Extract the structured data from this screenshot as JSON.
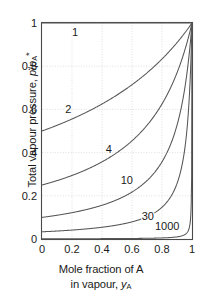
{
  "chart_data": {
    "type": "line",
    "title": "",
    "xlabel": "Mole fraction of A in vapour, yA",
    "ylabel": "Total vapour pressure, p/pA*",
    "xlim": [
      0,
      1
    ],
    "ylim": [
      0,
      1
    ],
    "grid": true,
    "legend_position": "inline-curve-labels",
    "x_ticks": [
      "0",
      "0.2",
      "0.4",
      "0.6",
      "0.8",
      "1"
    ],
    "x_tick_values": [
      0,
      0.2,
      0.4,
      0.6,
      0.8,
      1
    ],
    "y_ticks": [
      "0",
      "0.2",
      "0.4",
      "0.6",
      "0.8",
      "1"
    ],
    "y_tick_values": [
      0,
      0.2,
      0.4,
      0.6,
      0.8,
      1
    ],
    "x": [
      0,
      0.05,
      0.1,
      0.15,
      0.2,
      0.25,
      0.3,
      0.35,
      0.4,
      0.45,
      0.5,
      0.55,
      0.6,
      0.65,
      0.7,
      0.75,
      0.8,
      0.85,
      0.9,
      0.95,
      1
    ],
    "series": [
      {
        "name": "1",
        "ratio": 1,
        "values": [
          1,
          1,
          1,
          1,
          1,
          1,
          1,
          1,
          1,
          1,
          1,
          1,
          1,
          1,
          1,
          1,
          1,
          1,
          1,
          1,
          1
        ]
      },
      {
        "name": "2",
        "ratio": 2,
        "values": [
          0.5,
          0.513,
          0.526,
          0.541,
          0.556,
          0.571,
          0.588,
          0.606,
          0.625,
          0.645,
          0.667,
          0.69,
          0.714,
          0.741,
          0.769,
          0.8,
          0.833,
          0.87,
          0.909,
          0.952,
          1
        ]
      },
      {
        "name": "4",
        "ratio": 4,
        "values": [
          0.25,
          0.264,
          0.278,
          0.296,
          0.313,
          0.333,
          0.357,
          0.381,
          0.417,
          0.444,
          0.5,
          0.541,
          0.588,
          0.645,
          0.714,
          0.8,
          0.833,
          0.87,
          0.909,
          0.952,
          1
        ]
      },
      {
        "name": "10",
        "ratio": 10,
        "values": [
          0.1,
          0.105,
          0.11,
          0.117,
          0.122,
          0.129,
          0.137,
          0.146,
          0.156,
          0.168,
          0.182,
          0.198,
          0.217,
          0.241,
          0.27,
          0.308,
          0.357,
          0.426,
          0.526,
          0.69,
          1
        ]
      },
      {
        "name": "30",
        "ratio": 30,
        "values": [
          0.033,
          0.035,
          0.036,
          0.038,
          0.04,
          0.043,
          0.045,
          0.048,
          0.052,
          0.057,
          0.063,
          0.069,
          0.077,
          0.088,
          0.102,
          0.121,
          0.149,
          0.192,
          0.27,
          0.455,
          1
        ]
      },
      {
        "name": "1000",
        "ratio": 1000,
        "values": [
          0.001,
          0.00105,
          0.00111,
          0.00118,
          0.00125,
          0.00133,
          0.00143,
          0.00154,
          0.00166,
          0.00182,
          0.002,
          0.00222,
          0.0025,
          0.00285,
          0.00333,
          0.004,
          0.005,
          0.00665,
          0.00995,
          0.0196,
          1
        ]
      }
    ],
    "curve_labels": [
      {
        "text": "1",
        "x": 0.22,
        "y": 0.955
      },
      {
        "text": "2",
        "x": 0.175,
        "y": 0.595
      },
      {
        "text": "4",
        "x": 0.445,
        "y": 0.41
      },
      {
        "text": "10",
        "x": 0.565,
        "y": 0.27
      },
      {
        "text": "30",
        "x": 0.705,
        "y": 0.1
      },
      {
        "text": "1000",
        "x": 0.835,
        "y": 0.055
      }
    ],
    "ylabel_parts": {
      "prefix": "Total vapour pressure, ",
      "p": "p",
      "slash": "/",
      "p2": "p",
      "sub": "A",
      "star": "*"
    },
    "xlabel_parts": {
      "line1": "Mole fraction of A",
      "line2_prefix": "in vapour, ",
      "line2_var": "y",
      "line2_sub": "A"
    }
  }
}
